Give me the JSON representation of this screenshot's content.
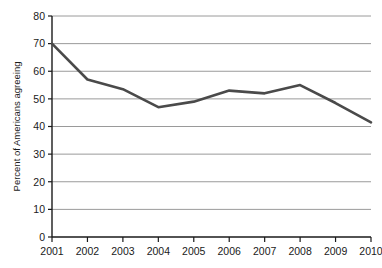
{
  "chart_data": {
    "type": "line",
    "title": "",
    "xlabel": "",
    "ylabel": "Percent of Americans agreeing",
    "categories": [
      "2001",
      "2002",
      "2003",
      "2004",
      "2005",
      "2006",
      "2007",
      "2008",
      "2009",
      "2010"
    ],
    "x": [
      2001,
      2002,
      2003,
      2004,
      2005,
      2006,
      2007,
      2008,
      2009,
      2010
    ],
    "values": [
      70,
      57,
      53.5,
      47,
      49,
      53,
      52,
      55,
      48.5,
      41.5
    ],
    "series": [
      {
        "name": "Percent of Americans agreeing",
        "values": [
          70,
          57,
          53.5,
          47,
          49,
          53,
          52,
          55,
          48.5,
          41.5
        ]
      }
    ],
    "ylim": [
      0,
      80
    ],
    "yticks": [
      0,
      10,
      20,
      30,
      40,
      50,
      60,
      70,
      80
    ],
    "ytick_labels": [
      "0",
      "10",
      "20",
      "30",
      "40",
      "50",
      "60",
      "70",
      "80"
    ],
    "xtick_labels": [
      "2001",
      "2002",
      "2003",
      "2004",
      "2005",
      "2006",
      "2007",
      "2008",
      "2009",
      "2010"
    ],
    "grid": "horizontal",
    "legend": "none",
    "line_color": "#4a4a4a",
    "grid_color": "#9a9a9a",
    "axis_color": "#1a1a1a",
    "background_color": "#ffffff"
  }
}
